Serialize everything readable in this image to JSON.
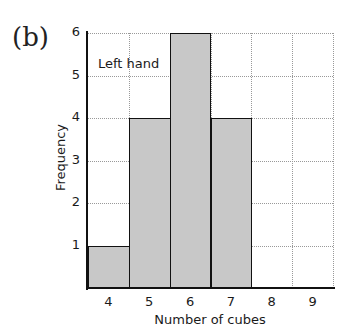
{
  "panel_label": "(b)",
  "chart_data": {
    "type": "bar",
    "title": "",
    "annotation": "Left hand",
    "xlabel": "Number of cubes",
    "ylabel": "Frequency",
    "categories": [
      "4",
      "5",
      "6",
      "7",
      "8",
      "9"
    ],
    "values": [
      1,
      4,
      6,
      4,
      0,
      0
    ],
    "ylim": [
      0,
      6
    ],
    "yticks": [
      "1",
      "2",
      "3",
      "4",
      "5",
      "6"
    ],
    "grid": true,
    "bar_color": "#c8c8c8",
    "edge_color": "#111111"
  }
}
